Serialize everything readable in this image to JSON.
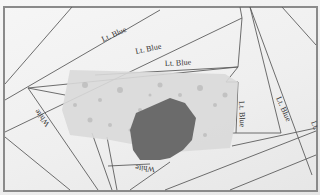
{
  "image": {
    "subject": "Foundation paper-piecing pattern with fabric pieces pinned on top",
    "colors": {
      "paper": "#f2f2f2",
      "line": "#5a5a5a",
      "border": "#8a8a8a",
      "light_fabric": "#dcdcdc",
      "dark_fabric": "#6a6a6a"
    }
  },
  "labels": [
    {
      "text": "Lt. Blue",
      "x": 122,
      "y": 38,
      "rotate": -24
    },
    {
      "text": "Lt. Blue",
      "x": 148,
      "y": 52,
      "rotate": -12
    },
    {
      "text": "Lt. Blue",
      "x": 172,
      "y": 66,
      "rotate": -3
    },
    {
      "text": "Lt. Blue",
      "x": 243,
      "y": 108,
      "rotate": 88
    },
    {
      "text": "Lt. Blue",
      "x": 282,
      "y": 104,
      "rotate": 66
    },
    {
      "text": "Lt. ",
      "x": 313,
      "y": 124,
      "rotate": 70
    },
    {
      "text": "White",
      "x": 42,
      "y": 112,
      "rotate": 232
    },
    {
      "text": "White",
      "x": 145,
      "y": 162,
      "rotate": 185
    }
  ]
}
